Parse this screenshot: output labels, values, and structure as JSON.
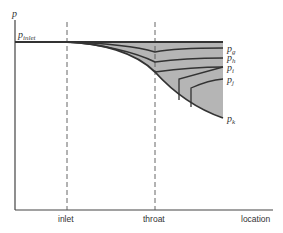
{
  "diagram": {
    "y_axis_label": "p",
    "inlet_pressure_label": "p",
    "inlet_pressure_sub": "inlet",
    "x_labels": {
      "inlet": "inlet",
      "throat": "throat",
      "location": "location"
    },
    "curve_labels": [
      {
        "main": "p",
        "sub": "g"
      },
      {
        "main": "p",
        "sub": "h"
      },
      {
        "main": "p",
        "sub": "i"
      },
      {
        "main": "p",
        "sub": "j"
      },
      {
        "main": "p",
        "sub": "k"
      }
    ],
    "colors": {
      "fill": "#b8b8b8",
      "line": "#333333"
    }
  }
}
